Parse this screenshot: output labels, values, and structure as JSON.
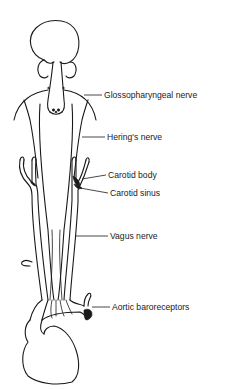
{
  "diagram": {
    "title": "",
    "labels": {
      "glossopharyngeal": "Glossopharyngeal nerve",
      "hering": "Hering's nerve",
      "carotid_body": "Carotid body",
      "carotid_sinus": "Carotid sinus",
      "vagus": "Vagus nerve",
      "aortic": "Aortic baroreceptors"
    },
    "colors": {
      "line": "#1a1a1a",
      "background": "#ffffff"
    }
  }
}
